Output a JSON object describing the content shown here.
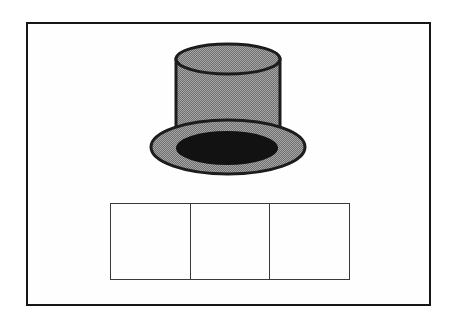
{
  "card": {
    "description": "phoneme segmentation flashcard: picture of a top hat above three empty sound boxes",
    "illustration": "top-hat",
    "sound_boxes": {
      "count": 3,
      "cells": [
        "",
        "",
        ""
      ]
    }
  },
  "colors": {
    "page_background": "#ffffff",
    "card_background": "#fefefe",
    "card_border": "#161616",
    "hat_fill_light": "#a6a6a6",
    "hat_fill_dark": "#6f6f6f",
    "hat_outline": "#1c1c1c",
    "hat_opening": "#121212",
    "box_border": "#3a3a3a",
    "box_fill": "#fefefe"
  }
}
